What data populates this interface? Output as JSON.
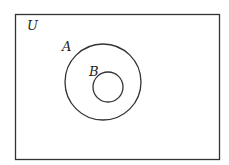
{
  "diagram": {
    "type": "venn",
    "universe": {
      "label": "U",
      "x": 15,
      "y": 14,
      "width": 204,
      "height": 145
    },
    "sets": [
      {
        "label": "A",
        "cx": 103,
        "cy": 82,
        "r": 38,
        "label_x": 62,
        "label_y": 51
      },
      {
        "label": "B",
        "cx": 108,
        "cy": 87,
        "r": 15,
        "label_x": 89,
        "label_y": 76
      }
    ],
    "relation": "B is a subset of A",
    "stroke_color": "#333333"
  }
}
